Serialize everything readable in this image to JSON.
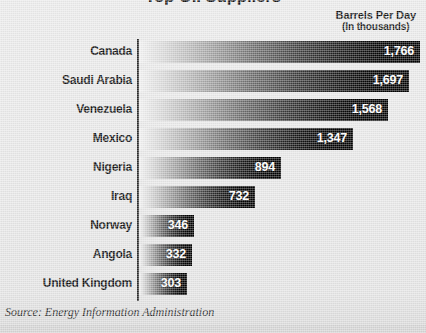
{
  "chart_data": {
    "type": "bar",
    "orientation": "horizontal",
    "title": "Top Oil Suppliers",
    "subtitle": "",
    "xlabel": "",
    "ylabel": "",
    "unit_caption_line1": "Barrels Per Day",
    "unit_caption_line2": "(In thousands)",
    "categories": [
      "Canada",
      "Saudi Arabia",
      "Venezuela",
      "Mexico",
      "Nigeria",
      "Iraq",
      "Norway",
      "Angola",
      "United Kingdom"
    ],
    "values": [
      1766,
      1697,
      1568,
      1347,
      894,
      732,
      346,
      332,
      303
    ],
    "value_labels": [
      "1,766",
      "1,697",
      "1,568",
      "1,347",
      "894",
      "732",
      "346",
      "332",
      "303"
    ],
    "xlim": [
      0,
      1766
    ],
    "grid": false,
    "legend": false,
    "bar_fill": "gradient light-gray to black",
    "colors": {
      "background": "#e9e9e9",
      "bar_start": "#f2f2f2",
      "bar_end": "#000000",
      "axis": "#2b2b2b",
      "label_text": "#101010",
      "value_text": "#ffffff"
    }
  },
  "source": {
    "text": "Source: Energy Information Administration"
  }
}
